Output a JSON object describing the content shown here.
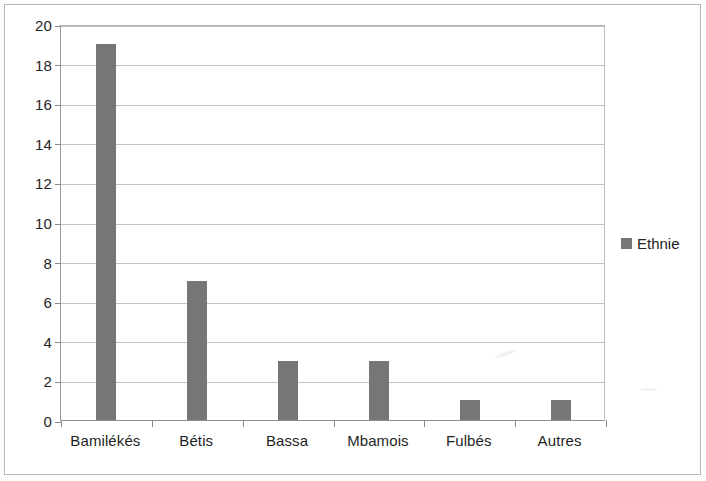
{
  "chart_data": {
    "type": "bar",
    "title": "",
    "xlabel": "",
    "ylabel": "",
    "categories": [
      "Bamilékés",
      "Bétis",
      "Bassa",
      "Mbamois",
      "Fulbés",
      "Autres"
    ],
    "values": [
      19,
      7,
      3,
      3,
      1,
      1
    ],
    "series": [
      {
        "name": "Ethnie",
        "values": [
          19,
          7,
          3,
          3,
          1,
          1
        ],
        "color": "#767676"
      }
    ],
    "ylim": [
      0,
      20
    ],
    "ytick_labels": [
      "0",
      "2",
      "4",
      "6",
      "8",
      "10",
      "12",
      "14",
      "16",
      "18",
      "20"
    ],
    "ytick_values": [
      0,
      2,
      4,
      6,
      8,
      10,
      12,
      14,
      16,
      18,
      20
    ],
    "grid": true,
    "legend": {
      "position": "right",
      "entries": [
        {
          "label": "Ethnie",
          "color": "#767676"
        }
      ]
    }
  }
}
